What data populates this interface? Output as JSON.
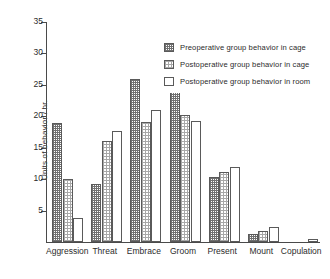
{
  "chart_data": {
    "type": "bar",
    "title": "",
    "xlabel": "",
    "ylabel": "Units of behavior / hr.",
    "ylim": [
      0,
      35
    ],
    "yticks": [
      5,
      10,
      15,
      20,
      25,
      30,
      35
    ],
    "grid": false,
    "legend_position": "upper-right",
    "categories": [
      "Aggression",
      "Threat",
      "Embrace",
      "Groom",
      "Present",
      "Mount",
      "Copulation"
    ],
    "series": [
      {
        "name": "Preoperative group behavior in cage",
        "swatch": "dense-checker",
        "values": [
          19.0,
          9.2,
          26.0,
          30.2,
          10.3,
          1.2,
          0.0
        ]
      },
      {
        "name": "Postoperative group behavior in cage",
        "swatch": "light-checker",
        "values": [
          10.1,
          16.1,
          19.1,
          20.2,
          11.1,
          1.8,
          0.0
        ]
      },
      {
        "name": "Postoperative group behavior in room",
        "swatch": "white",
        "values": [
          3.9,
          17.6,
          21.0,
          19.2,
          12.0,
          2.4,
          0.5
        ]
      }
    ]
  },
  "legend": {
    "items": [
      "Preoperative group behavior in cage",
      "Postoperative group behavior in cage",
      "Postoperative  group behavior in room"
    ]
  },
  "axis": {
    "y_title": "Units of behavior / hr.",
    "y_tick_labels": [
      "5",
      "10",
      "15",
      "20",
      "25",
      "30",
      "35"
    ]
  }
}
